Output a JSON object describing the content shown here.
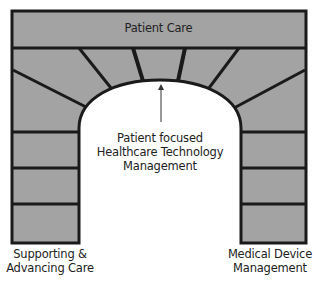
{
  "diagram": {
    "type": "arch",
    "keystone_band": {
      "label": "Patient Care"
    },
    "center": {
      "lines": [
        "Patient focused",
        "Healthcare Technology",
        "Management"
      ],
      "arrow": "up"
    },
    "left_pillar": {
      "lines": [
        "Supporting &",
        "Advancing Care"
      ]
    },
    "right_pillar": {
      "lines": [
        "Medical Device",
        "Management"
      ]
    },
    "colors": {
      "stone": "#a3a3a3",
      "mortar": "#1a1a1a",
      "background": "#ffffff",
      "text": "#222222"
    }
  },
  "caption": {
    "text": ""
  }
}
